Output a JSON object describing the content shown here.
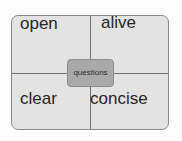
{
  "diagram": {
    "type": "quadrant",
    "center": {
      "label": "questions"
    },
    "quadrants": [
      {
        "position": "top-left",
        "label": "open"
      },
      {
        "position": "top-right",
        "label": "alive"
      },
      {
        "position": "bottom-left",
        "label": "clear"
      },
      {
        "position": "bottom-right",
        "label": "concise"
      }
    ],
    "colors": {
      "outer_fill": "#e3e3e3",
      "outer_border": "#8a8a8a",
      "divider": "#6f6f6f",
      "center_fill": "#a9a9a9",
      "text": "#262626"
    }
  }
}
